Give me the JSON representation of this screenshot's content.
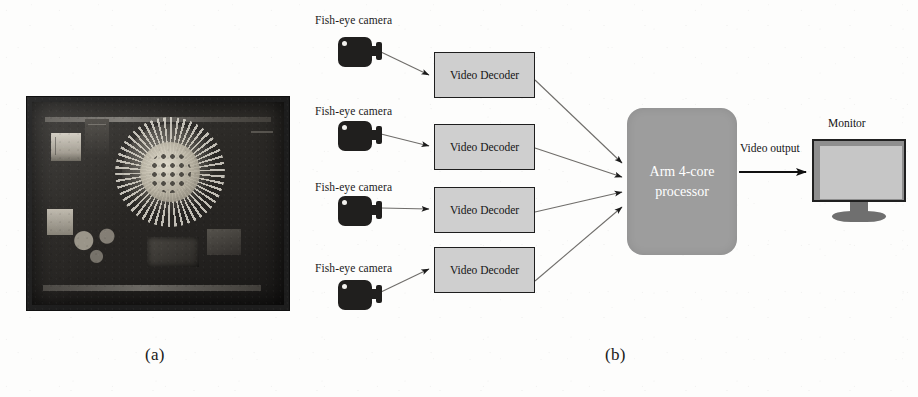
{
  "figure": {
    "background_color": "#fdfdfc",
    "captions": [
      {
        "id": "a",
        "text": "(a)"
      },
      {
        "id": "b",
        "text": "(b)"
      }
    ]
  },
  "panel_a": {
    "type": "photograph",
    "subject": "embedded circuit board with radial fan heatsink",
    "frame_color": "#1d1d1d"
  },
  "panel_b": {
    "type": "block-diagram",
    "cameras": [
      {
        "label": "Fish-eye camera"
      },
      {
        "label": "Fish-eye camera"
      },
      {
        "label": "Fish-eye camera"
      },
      {
        "label": "Fish-eye camera"
      }
    ],
    "decoders": [
      {
        "label": "Video Decoder"
      },
      {
        "label": "Video Decoder"
      },
      {
        "label": "Video Decoder"
      },
      {
        "label": "Video Decoder"
      }
    ],
    "processor": {
      "line1": "Arm 4-core",
      "line2": "processor",
      "fill_color": "#9d9d9d",
      "text_color": "#ffffff"
    },
    "output_link": {
      "label": "Video output"
    },
    "monitor": {
      "label": "Monitor",
      "bezel_color": "#8e8e8e",
      "screen_color": "#c6c6c6"
    },
    "decoder_style": {
      "fill_color": "#cfcfcf",
      "border_color": "#1e1e1e"
    },
    "camera_color": "#201f1e"
  }
}
